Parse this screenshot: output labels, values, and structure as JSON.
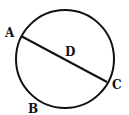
{
  "diagram": {
    "type": "circle-with-diameter",
    "colors": {
      "stroke": "#111111",
      "background": "#ffffff"
    },
    "circle": {
      "cx": 65,
      "cy": 59,
      "r": 49
    },
    "diameter": {
      "from": "A",
      "to": "C",
      "through": "D"
    },
    "points": {
      "A": {
        "label": "A",
        "x": 21,
        "y": 36
      },
      "B": {
        "label": "B",
        "x": 35,
        "y": 99
      },
      "C": {
        "label": "C",
        "x": 107,
        "y": 82
      },
      "D": {
        "label": "D",
        "x": 65,
        "y": 59
      }
    }
  }
}
